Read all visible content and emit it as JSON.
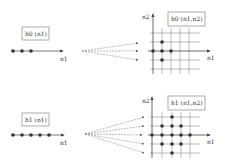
{
  "top": {
    "filter_1d_label": "h0 (n1)",
    "filter_2d_label": "h0 (n1,n2)",
    "axis_n1": "n1",
    "axis_n2": "n2",
    "dots_1d": [
      13,
      22,
      31
    ],
    "dots_2d": [
      [
        153,
        51
      ],
      [
        162,
        51
      ],
      [
        171,
        51
      ],
      [
        162,
        42
      ],
      [
        162,
        60
      ]
    ]
  },
  "bottom": {
    "filter_1d_label": "h1 (n1)",
    "filter_2d_label": "h1 (n1,n2)",
    "axis_n1": "n1",
    "axis_n2": "n2",
    "dots_1d": [
      13,
      22,
      31,
      40,
      49
    ],
    "dots_2d": [
      [
        172,
        117
      ],
      [
        162,
        126
      ],
      [
        172,
        126
      ],
      [
        181,
        126
      ],
      [
        152,
        135
      ],
      [
        162,
        135
      ],
      [
        172,
        135
      ],
      [
        181,
        135
      ],
      [
        190,
        135
      ],
      [
        162,
        144
      ],
      [
        172,
        144
      ],
      [
        181,
        144
      ],
      [
        172,
        153
      ]
    ]
  },
  "colors": {
    "line": "#555555",
    "dot": "#333333",
    "grid": "#777777"
  }
}
